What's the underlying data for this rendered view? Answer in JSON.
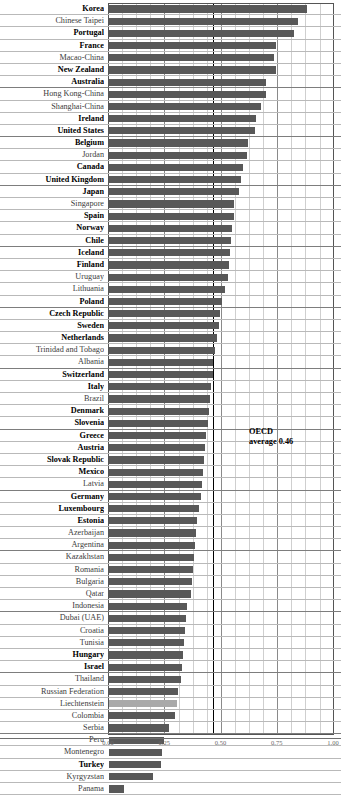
{
  "chart_data": {
    "type": "bar",
    "orientation": "horizontal",
    "title": "",
    "xlabel": "",
    "ylabel": "",
    "xlim": [
      0.0,
      1.0
    ],
    "grid": true,
    "gridlines_major": [
      0.0,
      0.25,
      0.5,
      0.75,
      1.0
    ],
    "gridlines_minor_step": 0.0625,
    "legend": "none",
    "annotations": [
      {
        "name": "oecd-average",
        "text_line1": "OECD",
        "text_line2": "average 0.46",
        "value": 0.46
      }
    ],
    "reference_line": {
      "label": "OECD average 0.46",
      "value": 0.46
    },
    "bar_color": "#585858",
    "highlight_bar_color": "#a9a9a9",
    "categories": [
      "Korea",
      "Chinese Taipei",
      "Portugal",
      "France",
      "Macao-China",
      "New Zealand",
      "Australia",
      "Hong Kong-China",
      "Shanghai-China",
      "Ireland",
      "United States",
      "Belgium",
      "Jordan",
      "Canada",
      "United Kingdom",
      "Japan",
      "Singapore",
      "Spain",
      "Norway",
      "Chile",
      "Iceland",
      "Finland",
      "Uruguay",
      "Lithuania",
      "Poland",
      "Czech Republic",
      "Sweden",
      "Netherlands",
      "Trinidad and Tobago",
      "Albania",
      "Switzerland",
      "Italy",
      "Brazil",
      "Denmark",
      "Slovenia",
      "Greece",
      "Austria",
      "Slovak Republic",
      "Mexico",
      "Latvia",
      "Germany",
      "Luxembourg",
      "Estonia",
      "Azerbaijan",
      "Argentina",
      "Kazakhstan",
      "Romania",
      "Bulgaria",
      "Qatar",
      "Indonesia",
      "Dubai (UAE)",
      "Croatia",
      "Tunisia",
      "Hungary",
      "Israel",
      "Thailand",
      "Russian Federation",
      "Liechtenstein",
      "Colombia",
      "Serbia",
      "Peru",
      "Montenegro",
      "Turkey",
      "Kyrgyzstan",
      "Panama"
    ],
    "values": [
      0.885,
      0.845,
      0.825,
      0.745,
      0.735,
      0.745,
      0.7,
      0.7,
      0.68,
      0.655,
      0.65,
      0.62,
      0.615,
      0.6,
      0.59,
      0.58,
      0.56,
      0.56,
      0.55,
      0.545,
      0.54,
      0.535,
      0.53,
      0.52,
      0.505,
      0.495,
      0.49,
      0.48,
      0.475,
      0.465,
      0.465,
      0.455,
      0.45,
      0.445,
      0.44,
      0.435,
      0.43,
      0.425,
      0.42,
      0.415,
      0.41,
      0.4,
      0.395,
      0.39,
      0.385,
      0.38,
      0.375,
      0.37,
      0.365,
      0.35,
      0.345,
      0.34,
      0.335,
      0.33,
      0.325,
      0.32,
      0.31,
      0.305,
      0.295,
      0.27,
      0.245,
      0.235,
      0.23,
      0.195,
      0.065
    ],
    "oecd_member": [
      true,
      false,
      true,
      true,
      false,
      true,
      true,
      false,
      false,
      true,
      true,
      true,
      false,
      true,
      true,
      true,
      false,
      true,
      true,
      true,
      true,
      true,
      false,
      false,
      true,
      true,
      true,
      true,
      false,
      false,
      true,
      true,
      false,
      true,
      true,
      true,
      true,
      true,
      true,
      false,
      true,
      true,
      true,
      false,
      false,
      false,
      false,
      false,
      false,
      false,
      false,
      false,
      false,
      true,
      true,
      false,
      false,
      false,
      false,
      false,
      false,
      false,
      true,
      false,
      false
    ],
    "highlight": [
      "Liechtenstein"
    ],
    "x_tick_labels": [
      "0.00",
      "0.25",
      "0.50",
      "0.75",
      "1.00"
    ]
  }
}
